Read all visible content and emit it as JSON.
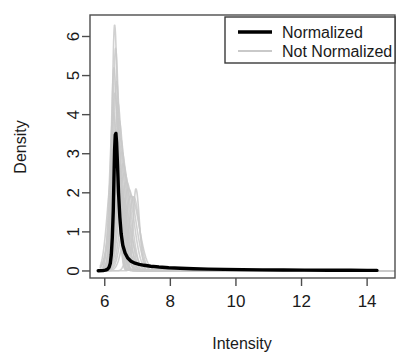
{
  "chart_data": {
    "type": "line",
    "title": "",
    "xlabel": "Intensity",
    "ylabel": "Density",
    "xlim": [
      5.55,
      14.85
    ],
    "ylim": [
      -0.18,
      6.55
    ],
    "xticks": [
      6,
      8,
      10,
      12,
      14
    ],
    "xtick_labels": [
      "6",
      "8",
      "10",
      "12",
      "14"
    ],
    "yticks": [
      0,
      1,
      2,
      3,
      4,
      5,
      6
    ],
    "ytick_labels": [
      "0",
      "1",
      "2",
      "3",
      "4",
      "5",
      "6"
    ],
    "grid": false,
    "legend_position": "top-right",
    "legend": [
      {
        "label": "Normalized",
        "color": "#000000",
        "linewidth": 3.4
      },
      {
        "label": "Not Normalized",
        "color": "#c9c9c9",
        "linewidth": 1.6
      }
    ],
    "series": [
      {
        "name": "Normalized",
        "color": "#000000",
        "linewidth": 3.4,
        "points": [
          [
            5.95,
            0.01
          ],
          [
            6.02,
            0.02
          ],
          [
            6.08,
            0.04
          ],
          [
            6.13,
            0.09
          ],
          [
            6.17,
            0.2
          ],
          [
            6.2,
            0.42
          ],
          [
            6.23,
            0.85
          ],
          [
            6.26,
            1.55
          ],
          [
            6.28,
            2.35
          ],
          [
            6.3,
            3.1
          ],
          [
            6.32,
            3.48
          ],
          [
            6.34,
            3.52
          ],
          [
            6.36,
            3.3
          ],
          [
            6.39,
            2.7
          ],
          [
            6.42,
            2.0
          ],
          [
            6.46,
            1.38
          ],
          [
            6.5,
            0.95
          ],
          [
            6.55,
            0.66
          ],
          [
            6.62,
            0.46
          ],
          [
            6.7,
            0.33
          ],
          [
            6.8,
            0.25
          ],
          [
            6.92,
            0.2
          ],
          [
            7.05,
            0.17
          ],
          [
            7.2,
            0.145
          ],
          [
            7.4,
            0.12
          ],
          [
            7.65,
            0.1
          ],
          [
            7.95,
            0.082
          ],
          [
            8.3,
            0.068
          ],
          [
            8.7,
            0.056
          ],
          [
            9.15,
            0.047
          ],
          [
            9.65,
            0.04
          ],
          [
            10.2,
            0.034
          ],
          [
            10.8,
            0.029
          ],
          [
            11.45,
            0.025
          ],
          [
            12.1,
            0.022
          ],
          [
            12.8,
            0.019
          ],
          [
            13.5,
            0.017
          ],
          [
            14.0,
            0.015
          ],
          [
            14.3,
            0.014
          ]
        ]
      },
      {
        "name": "Not Normalized",
        "color": "#c9c9c9",
        "linewidth": 1.6,
        "count": 26,
        "peak_density_max": 6.3,
        "peak_density_min": 1.9,
        "peak_intensity_range": [
          6.18,
          7.05
        ],
        "secondary_peak": {
          "intensity": 6.95,
          "density": 2.1
        },
        "curves": [
          {
            "mu": 6.3,
            "peak": 6.3,
            "width": 0.085,
            "tail": 0.03
          },
          {
            "mu": 6.33,
            "peak": 5.7,
            "width": 0.092,
            "tail": 0.032
          },
          {
            "mu": 6.28,
            "peak": 5.2,
            "width": 0.098,
            "tail": 0.03
          },
          {
            "mu": 6.36,
            "peak": 4.85,
            "width": 0.104,
            "tail": 0.034
          },
          {
            "mu": 6.31,
            "peak": 4.55,
            "width": 0.11,
            "tail": 0.031
          },
          {
            "mu": 6.4,
            "peak": 4.3,
            "width": 0.116,
            "tail": 0.035
          },
          {
            "mu": 6.26,
            "peak": 4.05,
            "width": 0.12,
            "tail": 0.03
          },
          {
            "mu": 6.44,
            "peak": 3.85,
            "width": 0.126,
            "tail": 0.036
          },
          {
            "mu": 6.34,
            "peak": 3.6,
            "width": 0.132,
            "tail": 0.032
          },
          {
            "mu": 6.48,
            "peak": 3.4,
            "width": 0.138,
            "tail": 0.037
          },
          {
            "mu": 6.29,
            "peak": 3.2,
            "width": 0.144,
            "tail": 0.031
          },
          {
            "mu": 6.52,
            "peak": 3.05,
            "width": 0.15,
            "tail": 0.038
          },
          {
            "mu": 6.38,
            "peak": 2.9,
            "width": 0.156,
            "tail": 0.033
          },
          {
            "mu": 6.56,
            "peak": 2.75,
            "width": 0.162,
            "tail": 0.039
          },
          {
            "mu": 6.24,
            "peak": 2.62,
            "width": 0.168,
            "tail": 0.03
          },
          {
            "mu": 6.6,
            "peak": 2.5,
            "width": 0.174,
            "tail": 0.04
          },
          {
            "mu": 6.42,
            "peak": 2.38,
            "width": 0.18,
            "tail": 0.034
          },
          {
            "mu": 6.66,
            "peak": 2.28,
            "width": 0.186,
            "tail": 0.041
          },
          {
            "mu": 6.32,
            "peak": 2.18,
            "width": 0.192,
            "tail": 0.032
          },
          {
            "mu": 6.72,
            "peak": 2.1,
            "width": 0.198,
            "tail": 0.042
          },
          {
            "mu": 6.95,
            "peak": 2.1,
            "width": 0.092,
            "tail": 0.044
          },
          {
            "mu": 6.46,
            "peak": 1.98,
            "width": 0.205,
            "tail": 0.035
          },
          {
            "mu": 6.8,
            "peak": 1.92,
            "width": 0.21,
            "tail": 0.043
          },
          {
            "mu": 6.36,
            "peak": 2.05,
            "width": 0.215,
            "tail": 0.033
          },
          {
            "mu": 6.88,
            "peak": 1.9,
            "width": 0.15,
            "tail": 0.045
          },
          {
            "mu": 6.5,
            "peak": 1.95,
            "width": 0.225,
            "tail": 0.036
          }
        ]
      }
    ]
  },
  "axes": {
    "x_title": "Intensity",
    "y_title": "Density"
  },
  "legend": {
    "items": [
      {
        "label": "Normalized"
      },
      {
        "label": "Not Normalized"
      }
    ]
  },
  "colors": {
    "normalized": "#000000",
    "not_normalized": "#c9c9c9",
    "frame": "#4d4d4d",
    "text": "#1a1a1a",
    "background": "#ffffff"
  }
}
